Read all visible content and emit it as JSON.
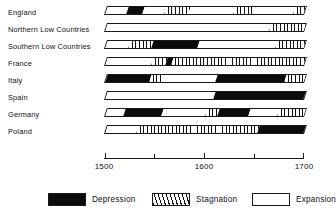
{
  "chart_data": {
    "type": "bar",
    "title": "",
    "xlabel": "",
    "ylabel": "",
    "xlim": [
      1500,
      1700
    ],
    "grid": false,
    "legend_position": "bottom",
    "axis": {
      "major_ticks": [
        1500,
        1600,
        1700
      ],
      "minor_ticks": [
        1550,
        1650
      ],
      "tick_labels": [
        "1500",
        "1600",
        "1700"
      ]
    },
    "categories": [
      "England",
      "Northern Low Countries",
      "Southern Low Countries",
      "France",
      "Italy",
      "Spain",
      "Germany",
      "Poland"
    ],
    "phase_types": [
      "Depression",
      "Stagnation",
      "Expansion"
    ],
    "series": [
      {
        "name": "England",
        "segments": [
          {
            "phase": "Expansion",
            "start": 1500,
            "end": 1521
          },
          {
            "phase": "Depression",
            "start": 1521,
            "end": 1537
          },
          {
            "phase": "Expansion",
            "start": 1537,
            "end": 1559
          },
          {
            "phase": "Stagnation",
            "start": 1559,
            "end": 1583
          },
          {
            "phase": "Expansion",
            "start": 1583,
            "end": 1628
          },
          {
            "phase": "Stagnation",
            "start": 1628,
            "end": 1648
          },
          {
            "phase": "Expansion",
            "start": 1648,
            "end": 1688
          },
          {
            "phase": "Stagnation",
            "start": 1688,
            "end": 1700
          }
        ]
      },
      {
        "name": "Northern Low Countries",
        "segments": [
          {
            "phase": "Expansion",
            "start": 1500,
            "end": 1664
          },
          {
            "phase": "Stagnation",
            "start": 1664,
            "end": 1700
          }
        ]
      },
      {
        "name": "Southern Low Countries",
        "segments": [
          {
            "phase": "Expansion",
            "start": 1500,
            "end": 1523
          },
          {
            "phase": "Stagnation",
            "start": 1523,
            "end": 1546
          },
          {
            "phase": "Depression",
            "start": 1546,
            "end": 1592
          },
          {
            "phase": "Expansion",
            "start": 1592,
            "end": 1670
          },
          {
            "phase": "Stagnation",
            "start": 1670,
            "end": 1700
          }
        ]
      },
      {
        "name": "France",
        "segments": [
          {
            "phase": "Expansion",
            "start": 1500,
            "end": 1546
          },
          {
            "phase": "Stagnation",
            "start": 1546,
            "end": 1560
          },
          {
            "phase": "Depression",
            "start": 1560,
            "end": 1566
          },
          {
            "phase": "Stagnation",
            "start": 1566,
            "end": 1700
          }
        ]
      },
      {
        "name": "Italy",
        "segments": [
          {
            "phase": "Depression",
            "start": 1500,
            "end": 1544
          },
          {
            "phase": "Stagnation",
            "start": 1544,
            "end": 1556
          },
          {
            "phase": "Expansion",
            "start": 1556,
            "end": 1610
          },
          {
            "phase": "Depression",
            "start": 1610,
            "end": 1679
          },
          {
            "phase": "Stagnation",
            "start": 1679,
            "end": 1700
          }
        ]
      },
      {
        "name": "Spain",
        "segments": [
          {
            "phase": "Expansion",
            "start": 1500,
            "end": 1608
          },
          {
            "phase": "Depression",
            "start": 1608,
            "end": 1700
          }
        ]
      },
      {
        "name": "Germany",
        "segments": [
          {
            "phase": "Expansion",
            "start": 1500,
            "end": 1518
          },
          {
            "phase": "Depression",
            "start": 1518,
            "end": 1556
          },
          {
            "phase": "Expansion",
            "start": 1556,
            "end": 1600
          },
          {
            "phase": "Stagnation",
            "start": 1600,
            "end": 1612
          },
          {
            "phase": "Depression",
            "start": 1612,
            "end": 1643
          },
          {
            "phase": "Expansion",
            "start": 1643,
            "end": 1672
          },
          {
            "phase": "Stagnation",
            "start": 1672,
            "end": 1700
          }
        ]
      },
      {
        "name": "Poland",
        "segments": [
          {
            "phase": "Expansion",
            "start": 1500,
            "end": 1531
          },
          {
            "phase": "Stagnation",
            "start": 1531,
            "end": 1652
          },
          {
            "phase": "Depression",
            "start": 1652,
            "end": 1700
          }
        ]
      }
    ],
    "legend": [
      {
        "label": "Depression",
        "pattern": "solid-black",
        "color": "#0b0b0b"
      },
      {
        "label": "Stagnation",
        "pattern": "diagonal-hatch",
        "color": "#ffffff"
      },
      {
        "label": "Expansion",
        "pattern": "empty-white",
        "color": "#ffffff"
      }
    ]
  }
}
